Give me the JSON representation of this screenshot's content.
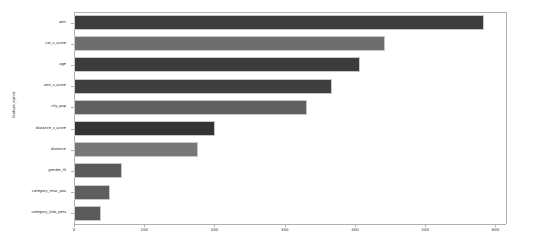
{
  "chart_data": {
    "type": "bar",
    "orientation": "horizontal",
    "title": "",
    "xlabel": "",
    "ylabel": "feature_name",
    "categories": [
      "amt",
      "cat_z_score",
      "age",
      "amt_z_score",
      "city_pop",
      "distance_z_score",
      "distance",
      "gender_M",
      "category_misc_pos",
      "category_kids_pets"
    ],
    "values": [
      583,
      443,
      407,
      368,
      331,
      201,
      177,
      69,
      51,
      39
    ],
    "xlim": [
      0,
      615
    ],
    "xticks": [
      0,
      100,
      200,
      300,
      400,
      500,
      600
    ],
    "xticklabels": [
      "0",
      "100",
      "200",
      "300",
      "400",
      "500",
      "600"
    ],
    "grid": false,
    "legend": false,
    "bar_colors": [
      "#3c3c3c",
      "#6e6e6e",
      "#3c3c3c",
      "#3f3f3f",
      "#606060",
      "#343434",
      "#777777",
      "#5a5a5a",
      "#5e5e5e",
      "#5a5a5a"
    ],
    "bar_edge_color": "#c8c8c8",
    "axis_color": "#b0b0b0",
    "background": "#ffffff"
  }
}
